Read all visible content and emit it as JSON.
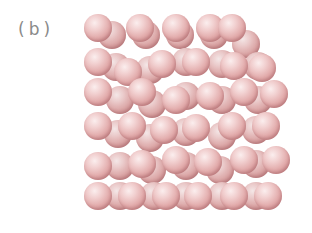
{
  "figure": {
    "label": "(b)",
    "sphere_color": "#e2abab",
    "highlight_color": "#fbeeee",
    "edge_color": "#b97878",
    "sphere_diameter": 28,
    "back_layer": [
      [
        112,
        35
      ],
      [
        146,
        35
      ],
      [
        180,
        35
      ],
      [
        214,
        35
      ],
      [
        246,
        44
      ],
      [
        116,
        67
      ],
      [
        150,
        70
      ],
      [
        186,
        62
      ],
      [
        222,
        64
      ],
      [
        258,
        66
      ],
      [
        120,
        100
      ],
      [
        152,
        104
      ],
      [
        186,
        96
      ],
      [
        222,
        100
      ],
      [
        258,
        100
      ],
      [
        118,
        134
      ],
      [
        150,
        138
      ],
      [
        186,
        132
      ],
      [
        222,
        136
      ],
      [
        256,
        130
      ],
      [
        120,
        166
      ],
      [
        152,
        170
      ],
      [
        186,
        166
      ],
      [
        220,
        170
      ],
      [
        256,
        164
      ],
      [
        120,
        196
      ],
      [
        154,
        196
      ],
      [
        186,
        196
      ],
      [
        222,
        196
      ],
      [
        256,
        196
      ]
    ],
    "front_layer": [
      [
        98,
        28
      ],
      [
        140,
        28
      ],
      [
        176,
        28
      ],
      [
        210,
        28
      ],
      [
        232,
        28
      ],
      [
        98,
        62
      ],
      [
        128,
        72
      ],
      [
        162,
        64
      ],
      [
        196,
        62
      ],
      [
        234,
        66
      ],
      [
        262,
        68
      ],
      [
        98,
        92
      ],
      [
        142,
        92
      ],
      [
        176,
        100
      ],
      [
        210,
        96
      ],
      [
        244,
        92
      ],
      [
        274,
        94
      ],
      [
        98,
        126
      ],
      [
        132,
        126
      ],
      [
        164,
        130
      ],
      [
        196,
        128
      ],
      [
        232,
        126
      ],
      [
        266,
        126
      ],
      [
        98,
        166
      ],
      [
        142,
        164
      ],
      [
        176,
        160
      ],
      [
        208,
        162
      ],
      [
        244,
        160
      ],
      [
        276,
        160
      ],
      [
        98,
        196
      ],
      [
        132,
        196
      ],
      [
        166,
        196
      ],
      [
        198,
        196
      ],
      [
        234,
        196
      ],
      [
        268,
        196
      ]
    ]
  }
}
